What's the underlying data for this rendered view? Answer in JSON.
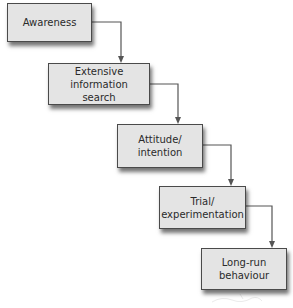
{
  "diagram": {
    "type": "staircase-flow",
    "colors": {
      "background": "#ffffff",
      "box_fill": "#e4e4e4",
      "box_border": "#4a4a4a",
      "connector": "#555555",
      "text": "#2a2a2a"
    },
    "nodes": [
      {
        "id": "awareness",
        "label": "Awareness"
      },
      {
        "id": "extensive-information-search",
        "label": "Extensive\ninformation search"
      },
      {
        "id": "attitude-intention",
        "label": "Attitude/\nintention"
      },
      {
        "id": "trial-experimentation",
        "label": "Trial/\nexperimentation"
      },
      {
        "id": "long-run-behaviour",
        "label": "Long-run\nbehaviour"
      }
    ],
    "edges": [
      {
        "from": "awareness",
        "to": "extensive-information-search"
      },
      {
        "from": "extensive-information-search",
        "to": "attitude-intention"
      },
      {
        "from": "attitude-intention",
        "to": "trial-experimentation"
      },
      {
        "from": "trial-experimentation",
        "to": "long-run-behaviour"
      }
    ]
  }
}
